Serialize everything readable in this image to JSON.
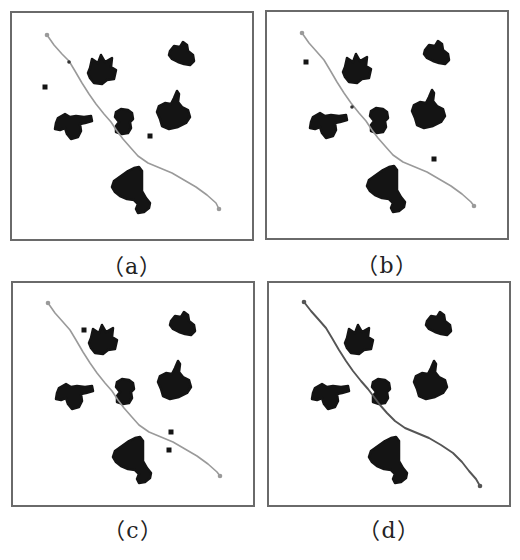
{
  "figure": {
    "panels": [
      {
        "id": "a",
        "label": "（a）",
        "position": {
          "x": 10,
          "y": 11,
          "w": 244,
          "h": 230
        },
        "caption_y": 248,
        "path_color": "#9a9a9a",
        "path_width": 1.6,
        "path": [
          [
            35,
            22
          ],
          [
            42,
            32
          ],
          [
            50,
            41
          ],
          [
            57,
            48
          ],
          [
            63,
            58
          ],
          [
            70,
            70
          ],
          [
            77,
            81
          ],
          [
            84,
            91
          ],
          [
            92,
            101
          ],
          [
            99,
            109
          ],
          [
            105,
            118
          ],
          [
            111,
            126
          ],
          [
            118,
            134
          ],
          [
            126,
            143
          ],
          [
            136,
            150
          ],
          [
            148,
            155
          ],
          [
            160,
            160
          ],
          [
            172,
            167
          ],
          [
            184,
            174
          ],
          [
            195,
            182
          ],
          [
            204,
            190
          ],
          [
            207,
            196
          ]
        ],
        "path_dot_marks": [
          [
            57,
            49
          ]
        ],
        "obstacle_dots": [
          [
            33,
            74
          ],
          [
            138,
            123
          ]
        ]
      },
      {
        "id": "b",
        "label": "（b）",
        "position": {
          "x": 265,
          "y": 10,
          "w": 244,
          "h": 230
        },
        "caption_y": 247,
        "path_color": "#9a9a9a",
        "path_width": 1.6,
        "path": [
          [
            35,
            21
          ],
          [
            42,
            31
          ],
          [
            50,
            40
          ],
          [
            57,
            48
          ],
          [
            63,
            58
          ],
          [
            70,
            70
          ],
          [
            77,
            81
          ],
          [
            84,
            91
          ],
          [
            92,
            101
          ],
          [
            99,
            109
          ],
          [
            105,
            118
          ],
          [
            111,
            126
          ],
          [
            118,
            134
          ],
          [
            126,
            143
          ],
          [
            136,
            150
          ],
          [
            148,
            155
          ],
          [
            160,
            160
          ],
          [
            172,
            167
          ],
          [
            184,
            174
          ],
          [
            195,
            182
          ],
          [
            204,
            190
          ],
          [
            207,
            194
          ]
        ],
        "path_dot_marks": [
          [
            85,
            95
          ]
        ],
        "obstacle_dots": [
          [
            39,
            50
          ],
          [
            167,
            147
          ]
        ]
      },
      {
        "id": "c",
        "label": "（c）",
        "position": {
          "x": 11,
          "y": 281,
          "w": 244,
          "h": 226
        },
        "caption_y": 512,
        "path_color": "#9a9a9a",
        "path_width": 1.6,
        "path": [
          [
            35,
            20
          ],
          [
            42,
            30
          ],
          [
            50,
            39
          ],
          [
            57,
            47
          ],
          [
            63,
            57
          ],
          [
            70,
            69
          ],
          [
            77,
            80
          ],
          [
            84,
            90
          ],
          [
            92,
            100
          ],
          [
            99,
            108
          ],
          [
            105,
            117
          ],
          [
            111,
            125
          ],
          [
            118,
            133
          ],
          [
            126,
            142
          ],
          [
            136,
            149
          ],
          [
            148,
            154
          ],
          [
            160,
            159
          ],
          [
            172,
            166
          ],
          [
            184,
            173
          ],
          [
            195,
            181
          ],
          [
            204,
            189
          ],
          [
            207,
            193
          ]
        ],
        "path_dot_marks": [],
        "obstacle_dots": [
          [
            71,
            47
          ],
          [
            158,
            149
          ],
          [
            156,
            167
          ]
        ]
      },
      {
        "id": "d",
        "label": "（d）",
        "position": {
          "x": 267,
          "y": 281,
          "w": 244,
          "h": 226
        },
        "caption_y": 512,
        "path_color": "#555555",
        "path_width": 1.9,
        "path": [
          [
            35,
            19
          ],
          [
            42,
            28
          ],
          [
            50,
            37
          ],
          [
            57,
            45
          ],
          [
            63,
            55
          ],
          [
            70,
            67
          ],
          [
            77,
            78
          ],
          [
            84,
            88
          ],
          [
            92,
            98
          ],
          [
            99,
            106
          ],
          [
            105,
            114
          ],
          [
            111,
            122
          ],
          [
            118,
            130
          ],
          [
            126,
            138
          ],
          [
            136,
            145
          ],
          [
            148,
            150
          ],
          [
            160,
            155
          ],
          [
            172,
            162
          ],
          [
            184,
            170
          ],
          [
            193,
            179
          ],
          [
            200,
            188
          ],
          [
            207,
            196
          ],
          [
            211,
            203
          ]
        ],
        "path_dot_marks": [],
        "obstacle_dots": []
      }
    ],
    "obstacle_blobs": [
      {
        "name": "obstacle-star-top",
        "d": "M78,55 L80,46 L86,50 L89,42 L93,49 L100,45 L99,54 L104,57 L102,66 L95,67 L90,71 L82,70 L78,65 L76,60 Z"
      },
      {
        "name": "obstacle-top-right",
        "d": "M158,38 L162,33 L168,34 L171,29 L175,32 L176,38 L181,42 L182,48 L178,52 L172,51 L166,49 L160,46 L157,42 Z"
      },
      {
        "name": "obstacle-cross-left",
        "d": "M46,105 L53,101 L58,104 L64,103 L72,104 L79,103 L80,108 L73,110 L68,111 L69,118 L66,124 L59,126 L55,121 L53,115 L48,117 L43,116 L44,110 Z"
      },
      {
        "name": "obstacle-small-mid",
        "d": "M104,99 L109,96 L116,97 L120,100 L121,106 L118,109 L119,115 L116,120 L110,121 L104,119 L104,113 L107,109 L103,104 Z"
      },
      {
        "name": "obstacle-big-right",
        "d": "M147,93 L153,90 L159,91 L162,85 L165,78 L167,81 L166,89 L170,94 L176,97 L178,104 L174,110 L166,114 L157,116 L150,113 L148,106 L145,99 Z"
      },
      {
        "name": "obstacle-bell-bottom",
        "d": "M102,168 L109,163 L116,158 L122,155 L127,154 L130,158 L130,168 L130,178 L134,185 L138,190 L137,195 L132,199 L126,200 L124,196 L126,191 L122,187 L115,186 L108,183 L103,179 L100,174 Z"
      }
    ],
    "colors": {
      "frame": "#6a6a6a",
      "obstacle": "#141414",
      "background": "#ffffff",
      "caption": "#222222"
    }
  }
}
